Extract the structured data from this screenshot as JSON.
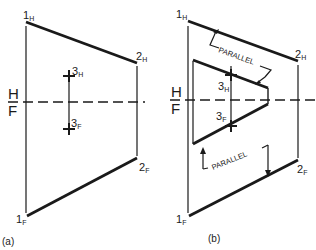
{
  "figure": {
    "panel_a": {
      "caption": "(a)",
      "fold_line_top": "H",
      "fold_line_bottom": "F",
      "points": {
        "p1h": {
          "main": "1",
          "sub": "H"
        },
        "p2h": {
          "main": "2",
          "sub": "H"
        },
        "p3h": {
          "main": "3",
          "sub": "H"
        },
        "p3f": {
          "main": "3",
          "sub": "F"
        },
        "p2f": {
          "main": "2",
          "sub": "F"
        },
        "p1f": {
          "main": "1",
          "sub": "F"
        }
      }
    },
    "panel_b": {
      "caption": "(b)",
      "fold_line_top": "H",
      "fold_line_bottom": "F",
      "parallel_label_top": "PARALLEL",
      "parallel_label_bottom": "PARALLEL",
      "points": {
        "p1h": {
          "main": "1",
          "sub": "H"
        },
        "p2h": {
          "main": "2",
          "sub": "H"
        },
        "p3h": {
          "main": "3",
          "sub": "H"
        },
        "p3f": {
          "main": "3",
          "sub": "F"
        },
        "p2f": {
          "main": "2",
          "sub": "F"
        },
        "p1f": {
          "main": "1",
          "sub": "F"
        }
      }
    }
  }
}
